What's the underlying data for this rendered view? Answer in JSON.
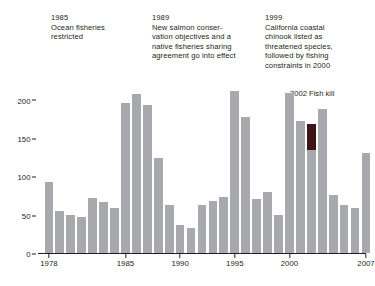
{
  "chart_data": {
    "type": "bar",
    "title": "",
    "xlabel": "",
    "ylabel": "",
    "ylim": [
      0,
      215
    ],
    "xlim": [
      1977.5,
      2007.5
    ],
    "grid": false,
    "legend": "none",
    "bar_color": "#a7a9ac",
    "highlight_color": "#3f1418",
    "y_ticks": [
      "0",
      "50",
      "100",
      "150",
      "200"
    ],
    "y_tick_values": [
      0,
      50,
      100,
      150,
      200
    ],
    "x_ticks": [
      "1978",
      "1985",
      "1990",
      "1995",
      "2000",
      "2007"
    ],
    "x_tick_values": [
      1978,
      1985,
      1990,
      1995,
      2000,
      2007
    ],
    "categories": [
      1978,
      1979,
      1980,
      1981,
      1982,
      1983,
      1984,
      1985,
      1986,
      1987,
      1988,
      1989,
      1990,
      1991,
      1992,
      1993,
      1994,
      1995,
      1996,
      1997,
      1998,
      1999,
      2000,
      2001,
      2002,
      2003,
      2004,
      2005,
      2006,
      2007
    ],
    "values": [
      93,
      55,
      50,
      47,
      72,
      66,
      59,
      195,
      207,
      193,
      124,
      62,
      37,
      33,
      62,
      68,
      73,
      211,
      177,
      71,
      79,
      49,
      208,
      172,
      149,
      188,
      76,
      63,
      59,
      130
    ],
    "highlight": {
      "category": 2002,
      "label": "2002 Fish kill",
      "segment_top": 168,
      "segment_bottom": 134
    },
    "annotations": [
      {
        "id": "1985",
        "year": "1985",
        "text": "1985\nOcean fisheries\nrestricted"
      },
      {
        "id": "1989",
        "year": "1989",
        "text": "1989\nNew salmon conser-\nvation objectives and a\nnative fisheries sharing\nagreement go into effect"
      },
      {
        "id": "1999",
        "year": "1999",
        "text": "1999\nCalifornia coastal\nchinook listed as\nthreatened species,\nfollowed by fishing\nconstraints in 2000"
      }
    ]
  }
}
